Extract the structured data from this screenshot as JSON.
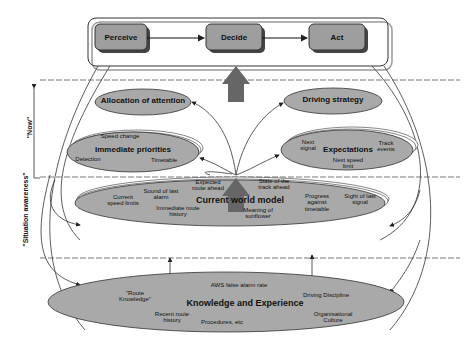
{
  "loop": {
    "perceive": "Perceive",
    "decide": "Decide",
    "act": "Act"
  },
  "axis": {
    "now": "\"Now\"",
    "situation_awareness": "\"Situation awareness\""
  },
  "now_layer": {
    "allocation": "Allocation of attention",
    "strategy": "Driving strategy",
    "immediate": {
      "title": "Immediate priorities",
      "items": [
        "Speed change",
        "Detection",
        "Timetable"
      ]
    },
    "expectations": {
      "title": "Expectations",
      "items": [
        "Next signal",
        "Track events",
        "Next speed limit"
      ]
    }
  },
  "world_model": {
    "title": "Current world model",
    "items": [
      "Current speed limits",
      "Sound of last alarm",
      "Immediate route history",
      "Expected route ahead",
      "State of the track ahead",
      "Meaning of sunflower",
      "Progress against timetable",
      "Sight of last signal"
    ]
  },
  "knowledge": {
    "title": "Knowledge and Experience",
    "items": [
      "\"Route Knowledge\"",
      "Recent route history",
      "Procedures, etc",
      "AWS false alarm rate",
      "Driving Discipline",
      "Organisational Culture"
    ]
  },
  "colors": {
    "ellipse_fill": "#a9a9a9",
    "box_fill": "#9e9e9e",
    "line": "#333333"
  }
}
